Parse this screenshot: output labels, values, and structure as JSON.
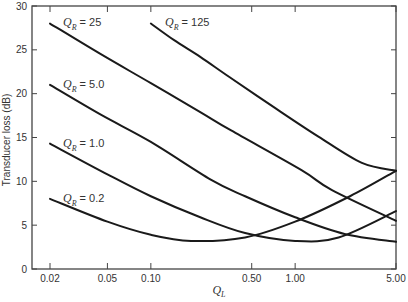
{
  "chart_data": {
    "type": "line",
    "title": "",
    "xlabel": "Q_L",
    "ylabel": "Transducer loss (dB)",
    "xscale": "log",
    "xlim": [
      0.02,
      5.0
    ],
    "ylim": [
      0,
      30
    ],
    "grid": false,
    "legend": "inline labels",
    "x_ticks": [
      "0.02",
      "0.05",
      "0.10",
      "0.50",
      "1.00",
      "5.00"
    ],
    "y_ticks": [
      "0",
      "5",
      "10",
      "15",
      "20",
      "25",
      "30"
    ],
    "series": [
      {
        "name": "Q_R = 0.2",
        "label_main": "Q",
        "label_sub": "R",
        "label_value": "= 0.2",
        "x": [
          0.02,
          0.05,
          0.1,
          0.19,
          0.45,
          1.0,
          2.4,
          5.0
        ],
        "y": [
          8.0,
          5.4,
          3.9,
          3.2,
          3.6,
          5.4,
          8.3,
          11.2
        ]
      },
      {
        "name": "Q_R = 1.0",
        "label_main": "Q",
        "label_sub": "R",
        "label_value": "= 1.0",
        "x": [
          0.02,
          0.05,
          0.1,
          0.22,
          0.45,
          1.0,
          2.0,
          5.0
        ],
        "y": [
          14.3,
          10.8,
          8.3,
          5.9,
          4.1,
          3.2,
          3.6,
          6.6
        ]
      },
      {
        "name": "Q_R = 5.0",
        "label_main": "Q",
        "label_sub": "R",
        "label_value": "= 5.0",
        "x": [
          0.02,
          0.045,
          0.1,
          0.26,
          0.45,
          1.0,
          2.2,
          5.0
        ],
        "y": [
          21.0,
          17.6,
          14.5,
          10.2,
          8.3,
          5.9,
          4.0,
          3.1
        ]
      },
      {
        "name": "Q_R = 25",
        "label_main": "Q",
        "label_sub": "R",
        "label_value": "= 25",
        "x": [
          0.02,
          0.045,
          0.1,
          0.22,
          0.36,
          1.1,
          1.8,
          5.0
        ],
        "y": [
          28.0,
          24.5,
          21.2,
          17.9,
          15.8,
          11.3,
          9.0,
          5.5
        ]
      },
      {
        "name": "Q_R = 125",
        "label_main": "Q",
        "label_sub": "R",
        "label_value": "= 125",
        "x": [
          0.1,
          0.145,
          0.22,
          0.35,
          0.72,
          1.45,
          2.9,
          5.0
        ],
        "y": [
          28.0,
          26.1,
          24.2,
          21.9,
          18.4,
          15.1,
          12.1,
          11.2
        ]
      }
    ]
  },
  "axes": {
    "y_title": "Transducer loss (dB)",
    "x_title_main": "Q",
    "x_title_sub": "L"
  }
}
